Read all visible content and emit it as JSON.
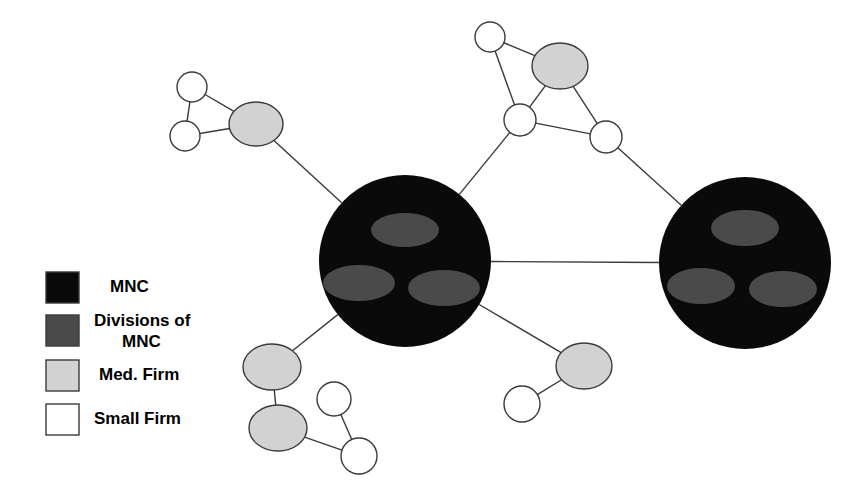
{
  "figure": {
    "background_color": "#ffffff",
    "edge_color": "#3a3a3a",
    "edge_width": 1.4
  },
  "palette": {
    "mnc_fill": "#0a0a0a",
    "division_fill": "#4a4a4a",
    "medium_firm_fill": "#d2d2d2",
    "small_firm_fill": "#ffffff",
    "node_stroke": "#3a3a3a",
    "swatch_stroke": "#3a3a3a",
    "text_color": "#000000"
  },
  "legend": {
    "items": [
      {
        "key": "mnc",
        "label": "MNC",
        "swatch_fill": "#0a0a0a",
        "x": 46,
        "y": 272,
        "w": 33,
        "h": 31,
        "label_x": 110,
        "label_y": 288
      },
      {
        "key": "divisions",
        "label_line1": "Divisions of",
        "label_line2": "MNC",
        "swatch_fill": "#4a4a4a",
        "x": 46,
        "y": 315,
        "w": 33,
        "h": 31,
        "label_x": 94,
        "label_y": 322
      },
      {
        "key": "medium",
        "label": "Med. Firm",
        "swatch_fill": "#d2d2d2",
        "x": 46,
        "y": 360,
        "w": 33,
        "h": 31,
        "label_x": 99,
        "label_y": 376
      },
      {
        "key": "small",
        "label": "Small Firm",
        "swatch_fill": "#ffffff",
        "x": 46,
        "y": 404,
        "w": 33,
        "h": 31,
        "label_x": 94,
        "label_y": 420
      }
    ]
  },
  "chart_data": {
    "type": "network",
    "node_types": [
      "MNC",
      "Divisions of MNC",
      "Med. Firm",
      "Small Firm"
    ],
    "counts": {
      "mnc": 2,
      "divisions": 6,
      "medium_firm": 5,
      "small_firm": 8
    },
    "nodes": [
      {
        "id": "mnc-left",
        "type": "MNC",
        "cx": 405,
        "cy": 261,
        "r": 86
      },
      {
        "id": "mnc-right",
        "type": "MNC",
        "cx": 745,
        "cy": 263,
        "r": 86
      },
      {
        "id": "div-left-top",
        "type": "Divisions of MNC",
        "cx": 405,
        "cy": 230,
        "rx": 34,
        "ry": 17
      },
      {
        "id": "div-left-bottomleft",
        "type": "Divisions of MNC",
        "cx": 359,
        "cy": 283,
        "rx": 36,
        "ry": 18
      },
      {
        "id": "div-left-bottomright",
        "type": "Divisions of MNC",
        "cx": 444,
        "cy": 288,
        "rx": 36,
        "ry": 18
      },
      {
        "id": "div-right-top",
        "type": "Divisions of MNC",
        "cx": 745,
        "cy": 228,
        "rx": 34,
        "ry": 18
      },
      {
        "id": "div-right-bottomleft",
        "type": "Divisions of MNC",
        "cx": 701,
        "cy": 286,
        "rx": 34,
        "ry": 18
      },
      {
        "id": "div-right-bottomright",
        "type": "Divisions of MNC",
        "cx": 783,
        "cy": 289,
        "rx": 34,
        "ry": 18
      },
      {
        "id": "med-upperleft",
        "type": "Med. Firm",
        "cx": 256,
        "cy": 124,
        "rx": 27,
        "ry": 22
      },
      {
        "id": "med-topmid",
        "type": "Med. Firm",
        "cx": 560,
        "cy": 66,
        "rx": 28,
        "ry": 23
      },
      {
        "id": "med-bottomleft-upper",
        "type": "Med. Firm",
        "cx": 272,
        "cy": 367,
        "rx": 29,
        "ry": 23
      },
      {
        "id": "med-bottomleft-lower",
        "type": "Med. Firm",
        "cx": 278,
        "cy": 428,
        "rx": 29,
        "ry": 23
      },
      {
        "id": "med-bottomright",
        "type": "Med. Firm",
        "cx": 584,
        "cy": 366,
        "rx": 28,
        "ry": 23
      },
      {
        "id": "small-upperleft-top",
        "type": "Small Firm",
        "cx": 192,
        "cy": 87,
        "r": 15
      },
      {
        "id": "small-upperleft-bottom",
        "type": "Small Firm",
        "cx": 185,
        "cy": 136,
        "r": 15
      },
      {
        "id": "small-topmid-left",
        "type": "Small Firm",
        "cx": 490,
        "cy": 37,
        "r": 15
      },
      {
        "id": "small-topmid-mid",
        "type": "Small Firm",
        "cx": 520,
        "cy": 120,
        "r": 16
      },
      {
        "id": "small-topmid-right",
        "type": "Small Firm",
        "cx": 606,
        "cy": 137,
        "r": 16
      },
      {
        "id": "small-bottomleft-upper",
        "type": "Small Firm",
        "cx": 334,
        "cy": 399,
        "r": 17
      },
      {
        "id": "small-bottomleft-lower",
        "type": "Small Firm",
        "cx": 359,
        "cy": 456,
        "r": 18
      },
      {
        "id": "small-bottomright",
        "type": "Small Firm",
        "cx": 522,
        "cy": 404,
        "r": 18
      }
    ],
    "edges": [
      {
        "source": "small-upperleft-top",
        "target": "small-upperleft-bottom"
      },
      {
        "source": "small-upperleft-top",
        "target": "med-upperleft"
      },
      {
        "source": "small-upperleft-bottom",
        "target": "med-upperleft"
      },
      {
        "source": "med-upperleft",
        "target": "mnc-left"
      },
      {
        "source": "small-topmid-left",
        "target": "med-topmid"
      },
      {
        "source": "small-topmid-left",
        "target": "small-topmid-mid"
      },
      {
        "source": "med-topmid",
        "target": "small-topmid-mid"
      },
      {
        "source": "med-topmid",
        "target": "small-topmid-right"
      },
      {
        "source": "small-topmid-mid",
        "target": "small-topmid-right"
      },
      {
        "source": "small-topmid-mid",
        "target": "mnc-left"
      },
      {
        "source": "small-topmid-right",
        "target": "mnc-right"
      },
      {
        "source": "mnc-left",
        "target": "mnc-right"
      },
      {
        "source": "mnc-left",
        "target": "med-bottomleft-upper"
      },
      {
        "source": "mnc-left",
        "target": "med-bottomright"
      },
      {
        "source": "med-bottomleft-upper",
        "target": "med-bottomleft-lower"
      },
      {
        "source": "med-bottomleft-lower",
        "target": "small-bottomleft-lower"
      },
      {
        "source": "small-bottomleft-upper",
        "target": "small-bottomleft-lower"
      },
      {
        "source": "med-bottomright",
        "target": "small-bottomright"
      }
    ]
  }
}
